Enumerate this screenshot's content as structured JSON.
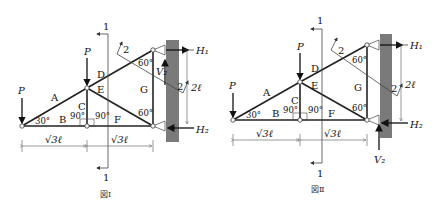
{
  "figures": [
    {
      "caption": "図Ⅰ",
      "members": [
        "A",
        "B",
        "C",
        "D",
        "E",
        "F",
        "G"
      ],
      "loads": {
        "left": "P",
        "middle": "P"
      },
      "reactions": {
        "h1": "H₁",
        "h2": "H₂",
        "v2": "V₂"
      },
      "v2_direction": "up-inside",
      "angles": {
        "left_base": "30°",
        "c_left": "90°",
        "c_right": "90°",
        "top_right": "60°",
        "bottom_right": "60°"
      },
      "dimensions": {
        "span_left": "√3ℓ",
        "span_right": "√3ℓ",
        "height": "2ℓ"
      },
      "sections": {
        "cut1_top": "1",
        "cut1_bottom": "1",
        "cut2_top": "2",
        "cut2_bottom": "2"
      }
    },
    {
      "caption": "図Ⅱ",
      "members": [
        "A",
        "B",
        "C",
        "D",
        "E",
        "F",
        "G"
      ],
      "loads": {
        "left": "P",
        "middle": "P"
      },
      "reactions": {
        "h1": "H₁",
        "h2": "H₂",
        "v2": "V₂"
      },
      "v2_direction": "up-below",
      "angles": {
        "left_base": "30°",
        "c_left": "90°",
        "c_right": "90°",
        "top_right": "60°",
        "bottom_right": "60°"
      },
      "dimensions": {
        "span_left": "√3ℓ",
        "span_right": "√3ℓ",
        "height": "2ℓ"
      },
      "sections": {
        "cut1_top": "1",
        "cut1_bottom": "1",
        "cut2_top": "2",
        "cut2_bottom": "2"
      }
    }
  ]
}
